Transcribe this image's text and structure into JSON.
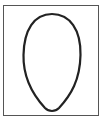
{
  "figure": {
    "frame_color": "#555555",
    "outline_color": "#222222",
    "fill_color": "#ffffff"
  }
}
